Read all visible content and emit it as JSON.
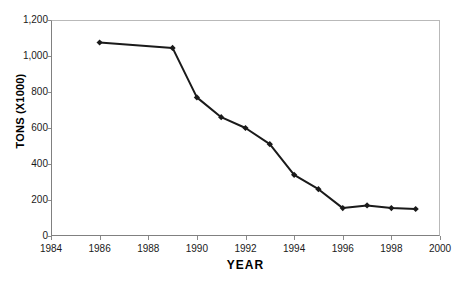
{
  "figure": {
    "top_clipped_text": "",
    "background_color": "#ffffff",
    "frame_color": "#b9b9b9",
    "axis_color": "#808080",
    "series_color": "#1a1a1a"
  },
  "axes": {
    "x_title": "YEAR",
    "y_title": "TONS (X1000)",
    "x_ticks": [
      "1984",
      "1986",
      "1988",
      "1990",
      "1992",
      "1994",
      "1996",
      "1998",
      "2000"
    ],
    "y_ticks": [
      "0",
      "200",
      "400",
      "600",
      "800",
      "1,000",
      "1,200"
    ]
  },
  "chart_data": {
    "type": "line",
    "title": "",
    "subtitle": "",
    "xlabel": "YEAR",
    "ylabel": "TONS (X1000)",
    "xlim": [
      1984,
      2000
    ],
    "ylim": [
      0,
      1200
    ],
    "xtick_values": [
      1984,
      1986,
      1988,
      1990,
      1992,
      1994,
      1996,
      1998,
      2000
    ],
    "ytick_values": [
      0,
      200,
      400,
      600,
      800,
      1000,
      1200
    ],
    "xtick_labels": [
      "1984",
      "1986",
      "1988",
      "1990",
      "1992",
      "1994",
      "1996",
      "1998",
      "2000"
    ],
    "ytick_labels": [
      "0",
      "200",
      "400",
      "600",
      "800",
      "1,000",
      "1,200"
    ],
    "grid": false,
    "legend": false,
    "legend_position": "none",
    "marker": "diamond",
    "x": [
      1986,
      1989,
      1990,
      1991,
      1992,
      1993,
      1994,
      1995,
      1996,
      1997,
      1998,
      1999
    ],
    "values": [
      1075,
      1045,
      770,
      660,
      600,
      510,
      340,
      260,
      155,
      170,
      155,
      150
    ],
    "series": [
      {
        "name": "TONS (X1000)",
        "x": [
          1986,
          1989,
          1990,
          1991,
          1992,
          1993,
          1994,
          1995,
          1996,
          1997,
          1998,
          1999
        ],
        "values": [
          1075,
          1045,
          770,
          660,
          600,
          510,
          340,
          260,
          155,
          170,
          155,
          150
        ]
      }
    ],
    "annotations": []
  }
}
